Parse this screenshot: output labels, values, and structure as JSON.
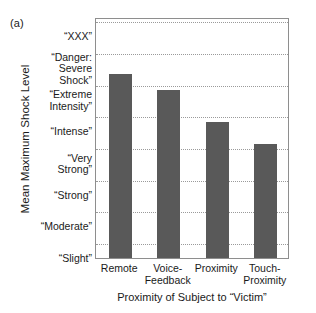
{
  "panel": {
    "label": "(a)"
  },
  "chart_data": {
    "type": "bar",
    "title": "",
    "panel_label": "(a)",
    "xlabel": "Proximity of Subject to “Victim”",
    "ylabel": "Mean Maximum Shock Level",
    "categories": [
      "Remote",
      "Voice-\nFeedback",
      "Proximity",
      "Touch-\nProximity"
    ],
    "category_labels_flat": [
      "Remote",
      "Voice-Feedback",
      "Proximity",
      "Touch-Proximity"
    ],
    "values": [
      6.8,
      6.3,
      5.3,
      4.6
    ],
    "ylim": [
      1,
      8.6
    ],
    "y_tick_labels": [
      "“Slight”",
      "“Moderate”",
      "“Strong”",
      "“Very\nStrong”",
      "“Intense”",
      "“Extreme\nIntensity”",
      "“Danger:\nSevere\nShock”",
      "“XXX”"
    ],
    "y_tick_values": [
      1,
      2,
      3,
      4,
      5,
      6,
      7,
      8
    ],
    "grid": true,
    "grid_style": "dotted",
    "grid_axis": "y",
    "legend": "none",
    "bar_color": "#595959",
    "grid_color": "#9a9a9a",
    "axis_color": "#8e8e8e",
    "text_color": "#1a1a1a"
  },
  "axes": {
    "y_title": "Mean Maximum Shock Level",
    "x_title": "Proximity of Subject to “Victim”"
  }
}
